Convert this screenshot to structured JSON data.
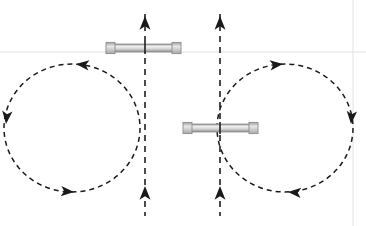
{
  "canvas": {
    "width": 366,
    "height": 226,
    "background": "#ffffff"
  },
  "style": {
    "stroke_dark": "#1a1a1a",
    "stroke_axis": "#1f1f1f",
    "magnet_fill": "#d4d4d4",
    "magnet_edge": "#8c8c8c",
    "magnet_highlight": "#f2f2f2",
    "cap_fill": "#b8b8b8",
    "faint_line": "#e2e2e2",
    "dash_loop": "5,4",
    "dash_axis": "6,5",
    "loop_stroke_width": 1.5,
    "axis_stroke_width": 1.6
  },
  "diagram": {
    "loops": [
      {
        "id": "left-loop",
        "name": "left-field-loop",
        "cx": 72,
        "cy": 128,
        "rx": 68,
        "ry": 64,
        "direction": "counterclockwise",
        "arrows": [
          {
            "id": "left-loop-arrow-top",
            "x": 76,
            "y": 64,
            "angle": 186,
            "label": "top-arrow-left"
          },
          {
            "id": "left-loop-arrow-left",
            "x": 6,
            "y": 124,
            "angle": 96,
            "label": "left-arrow-down"
          },
          {
            "id": "left-loop-arrow-bottom",
            "x": 74,
            "y": 192,
            "angle": 4,
            "label": "bottom-arrow-right"
          }
        ]
      },
      {
        "id": "right-loop",
        "name": "right-field-loop",
        "cx": 285,
        "cy": 128,
        "rx": 68,
        "ry": 64,
        "direction": "clockwise",
        "arrows": [
          {
            "id": "right-loop-arrow-top",
            "x": 283,
            "y": 64,
            "angle": -6,
            "label": "top-arrow-right"
          },
          {
            "id": "right-loop-arrow-right",
            "x": 351,
            "y": 124,
            "angle": 94,
            "label": "right-arrow-down"
          },
          {
            "id": "right-loop-arrow-bottom",
            "x": 288,
            "y": 192,
            "angle": 184,
            "label": "bottom-arrow-left"
          }
        ]
      }
    ],
    "axes": [
      {
        "id": "left-axis",
        "name": "left-vertical-axis",
        "x": 145,
        "y_top": 14,
        "y_bottom": 216,
        "direction": "up",
        "arrows": [
          {
            "id": "left-axis-arrow-top",
            "x": 145,
            "y": 16,
            "label": "axis-arrow-up-top"
          },
          {
            "id": "left-axis-arrow-mid",
            "x": 145,
            "y": 186,
            "label": "axis-arrow-up-lower"
          }
        ]
      },
      {
        "id": "right-axis",
        "name": "right-vertical-axis",
        "x": 220,
        "y_top": 14,
        "y_bottom": 216,
        "direction": "up",
        "arrows": [
          {
            "id": "right-axis-arrow-top",
            "x": 220,
            "y": 16,
            "label": "axis-arrow-up-top"
          },
          {
            "id": "right-axis-arrow-mid",
            "x": 220,
            "y": 186,
            "label": "axis-arrow-up-lower"
          }
        ]
      }
    ],
    "magnets": [
      {
        "id": "upper-magnet",
        "name": "upper-bar-magnet",
        "x1": 106,
        "x2": 181,
        "y": 48,
        "thickness": 8,
        "cap_width": 9,
        "on_axis": "left-axis"
      },
      {
        "id": "lower-magnet",
        "name": "lower-bar-magnet",
        "x1": 183,
        "x2": 258,
        "y": 128,
        "thickness": 8,
        "cap_width": 9,
        "on_axis": "right-axis"
      }
    ],
    "guides": [
      {
        "id": "faint-horizontal-guide",
        "name": "faint-horizontal-rule",
        "orientation": "horizontal",
        "x1": 0,
        "x2": 366,
        "y": 52
      },
      {
        "id": "faint-vertical-guide",
        "name": "faint-vertical-rule",
        "orientation": "vertical",
        "x": 353,
        "y1": 0,
        "y2": 226
      }
    ]
  }
}
